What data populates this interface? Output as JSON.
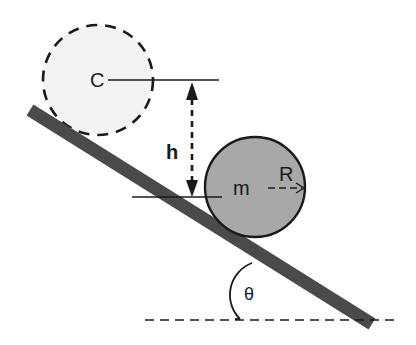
{
  "diagram": {
    "labels": {
      "center": "C",
      "height": "h",
      "mass": "m",
      "radius": "R",
      "angle": "θ"
    },
    "colors": {
      "incline": "#4a4a4a",
      "ball_fill": "#a8a8a8",
      "ball_stroke": "#1a1a1a",
      "ghost_fill": "#f3f3f3",
      "ghost_stroke": "#1a1a1a",
      "line": "#1a1a1a"
    },
    "elements": [
      {
        "id": "initial-ball",
        "type": "circle",
        "style": "dashed",
        "label": "C"
      },
      {
        "id": "final-ball",
        "type": "circle",
        "style": "solid",
        "label": "m",
        "radius_label": "R"
      },
      {
        "id": "incline",
        "type": "bar"
      },
      {
        "id": "height-arrow",
        "type": "double-arrow",
        "style": "dashed",
        "label": "h"
      },
      {
        "id": "baseline",
        "type": "line",
        "style": "dashed"
      },
      {
        "id": "angle-arc",
        "type": "arc",
        "label": "θ"
      }
    ]
  }
}
